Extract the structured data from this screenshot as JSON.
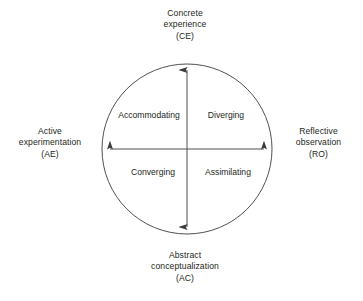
{
  "diagram": {
    "background_color": "#ffffff",
    "stroke_color": "#3c3c3c",
    "text_color": "#231f20",
    "circle": {
      "center_x": 187,
      "center_y": 149,
      "radius": 85
    },
    "poles": {
      "top": "Concrete\nexperience\n(CE)",
      "bottom": "Abstract\nconceptualization\n(AC)",
      "left": "Active\nexperimentation\n(AE)",
      "right": "Reflective\nobservation\n(RO)"
    },
    "pole_codes": {
      "top": "CE",
      "bottom": "AC",
      "left": "AE",
      "right": "RO"
    },
    "quadrants": {
      "top_left": "Accommodating",
      "top_right": "Diverging",
      "bottom_left": "Converging",
      "bottom_right": "Assimilating"
    },
    "axes": {
      "vertical": {
        "from": "Abstract conceptualization (AC)",
        "to": "Concrete experience (CE)",
        "double_headed": true
      },
      "horizontal": {
        "from": "Active experimentation (AE)",
        "to": "Reflective observation (RO)",
        "double_headed": true
      }
    }
  }
}
